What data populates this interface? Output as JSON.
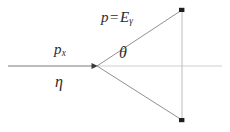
{
  "figure": {
    "type": "physics-vector-diagram",
    "background_color": "#ffffff",
    "line_color": "#6e6e6e",
    "axis_color": "#c8c8c8",
    "text_color": "#2b2b2b",
    "width": 230,
    "height": 132
  },
  "labels": {
    "photon": {
      "momentum_symbol": "p",
      "equals": "=",
      "energy_symbol": "E",
      "energy_subscript": "γ",
      "full_text": "p = Eγ"
    },
    "incoming": {
      "symbol": "p",
      "subscript": "x",
      "full_text": "px"
    },
    "pseudorapidity": {
      "symbol": "η",
      "full_text": "η"
    },
    "angle": {
      "symbol": "θ",
      "full_text": "θ"
    }
  },
  "geometry": {
    "vertex": {
      "x": 97,
      "y": 66
    },
    "incoming_line": {
      "x1": 8,
      "y1": 66,
      "x2": 97,
      "y2": 66
    },
    "axis_line": {
      "x1": 97,
      "y1": 66,
      "x2": 222,
      "y2": 66
    },
    "upper_ray": {
      "x1": 97,
      "y1": 66,
      "x2": 182,
      "y2": 10
    },
    "lower_ray": {
      "x1": 97,
      "y1": 66,
      "x2": 182,
      "y2": 120
    },
    "vertical_line": {
      "x1": 182,
      "y1": 10,
      "x2": 182,
      "y2": 120
    },
    "endpoint_top": {
      "x": 182,
      "y": 10
    },
    "endpoint_bottom": {
      "x": 182,
      "y": 120
    }
  }
}
